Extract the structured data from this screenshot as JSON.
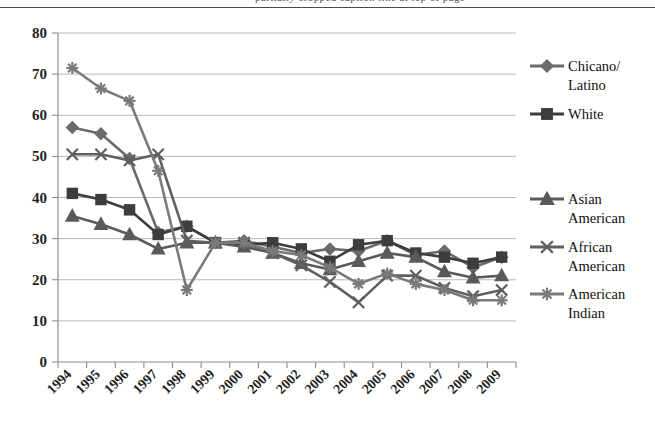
{
  "figure": {
    "cropped_header_text": "partially cropped caption line at top of page",
    "top_rule": true
  },
  "chart_data": {
    "type": "line",
    "title": "",
    "subtitle": "",
    "xlabel": "",
    "ylabel": "",
    "x": [
      "1994",
      "1995",
      "1996",
      "1997",
      "1998",
      "1999",
      "2000",
      "2001",
      "2002",
      "2003",
      "2004",
      "2005",
      "2006",
      "2007",
      "2008",
      "2009"
    ],
    "categories": [
      "1994",
      "1995",
      "1996",
      "1997",
      "1998",
      "1999",
      "2000",
      "2001",
      "2002",
      "2003",
      "2004",
      "2005",
      "2006",
      "2007",
      "2008",
      "2009"
    ],
    "ylim": [
      0,
      80
    ],
    "yticks": [
      0,
      10,
      20,
      30,
      40,
      50,
      60,
      70,
      80
    ],
    "ytick_labels": [
      "0",
      "10",
      "20",
      "30",
      "40",
      "50",
      "60",
      "70",
      "80"
    ],
    "grid": "horizontal",
    "legend_position": "right",
    "xtick_rotation": 45,
    "series": [
      {
        "name": "Chicano/ Latino",
        "legend_label": "Chicano/\nLatino",
        "marker": "diamond",
        "color": "#6b6b6b",
        "values": [
          57,
          55.5,
          49.5,
          31.5,
          33,
          29,
          29.5,
          28,
          26.5,
          27.5,
          27,
          29.5,
          26,
          27,
          23,
          25.5
        ]
      },
      {
        "name": "White",
        "legend_label": "White",
        "marker": "square",
        "color": "#3d3d3d",
        "values": [
          41,
          39.5,
          37,
          31,
          33,
          29,
          28.5,
          29,
          27.5,
          24.5,
          28.5,
          29.5,
          26.5,
          25.5,
          24,
          25.5
        ]
      },
      {
        "name": "Asian American",
        "legend_label": "Asian\nAmerican",
        "marker": "triangle",
        "color": "#5a5a5a",
        "values": [
          35.5,
          33.5,
          31,
          27.5,
          29,
          29,
          28,
          26.5,
          24,
          22.5,
          24.5,
          26.5,
          25.5,
          22,
          20.5,
          21
        ]
      },
      {
        "name": "African American",
        "legend_label": "African\nAmerican",
        "marker": "cross",
        "color": "#5f5f5f",
        "values": [
          50.5,
          50.5,
          49,
          50.5,
          29.5,
          29,
          29,
          26.5,
          23.5,
          19.5,
          14.5,
          21,
          21,
          18,
          16,
          17.5
        ]
      },
      {
        "name": "American Indian",
        "legend_label": "American\nIndian",
        "marker": "star",
        "color": "#7a7a7a",
        "values": [
          71.5,
          66.5,
          63.5,
          46.5,
          17.5,
          29,
          29,
          27,
          26,
          23,
          19,
          21.5,
          19,
          17.5,
          15,
          15
        ]
      }
    ],
    "legend_entries": [
      {
        "label_line1": "Chicano/",
        "label_line2": "Latino",
        "marker": "diamond"
      },
      {
        "label_line1": "White",
        "label_line2": "",
        "marker": "square"
      },
      {
        "label_line1": "Asian",
        "label_line2": "American",
        "marker": "triangle"
      },
      {
        "label_line1": "African",
        "label_line2": "American",
        "marker": "cross"
      },
      {
        "label_line1": "American",
        "label_line2": "Indian",
        "marker": "star"
      }
    ]
  },
  "colors": {
    "grid": "#b9b9b9",
    "axis": "#8d8d8d",
    "text": "#1f1f1f",
    "background": "#ffffff"
  }
}
